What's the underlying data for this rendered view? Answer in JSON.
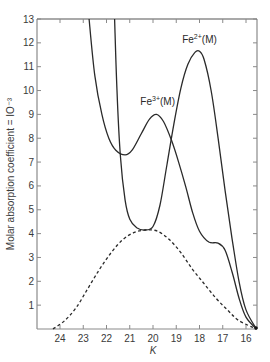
{
  "chart_data": {
    "type": "line",
    "title": "",
    "xlabel": "K",
    "ylabel": "Molar absorption coefficient = 10^-3",
    "ylabel_display": "Molar absorption coefficient = IO⁻³",
    "xlim": [
      25.0,
      15.5
    ],
    "ylim": [
      0,
      13
    ],
    "x_reversed": true,
    "grid": false,
    "x_ticks": [
      24,
      23,
      22,
      21,
      20,
      19,
      18,
      17,
      16
    ],
    "y_ticks": [
      1,
      2,
      3,
      4,
      5,
      6,
      7,
      8,
      9,
      10,
      11,
      12,
      13
    ],
    "annotations": [
      {
        "text": "Fe3+(M)",
        "base": "Fe",
        "sup": "3+",
        "suffix": "(M)",
        "x": 19.8,
        "y": 9.4
      },
      {
        "text": "Fe2+(M)",
        "base": "Fe",
        "sup": "2+",
        "suffix": "(M)",
        "x": 18.0,
        "y": 12.0
      }
    ],
    "series": [
      {
        "name": "Fe3+(M) spectrum",
        "style": "solid",
        "points": [
          [
            22.75,
            13.0
          ],
          [
            22.5,
            10.6
          ],
          [
            22.2,
            9.0
          ],
          [
            21.9,
            8.0
          ],
          [
            21.6,
            7.5
          ],
          [
            21.2,
            7.3
          ],
          [
            20.9,
            7.5
          ],
          [
            20.5,
            8.2
          ],
          [
            20.15,
            8.8
          ],
          [
            19.85,
            9.0
          ],
          [
            19.55,
            8.7
          ],
          [
            19.2,
            7.9
          ],
          [
            18.9,
            7.0
          ],
          [
            18.6,
            6.0
          ],
          [
            18.3,
            4.9
          ],
          [
            18.0,
            4.1
          ],
          [
            17.6,
            3.65
          ],
          [
            17.2,
            3.6
          ],
          [
            16.9,
            3.3
          ],
          [
            16.6,
            2.4
          ],
          [
            16.3,
            1.3
          ],
          [
            16.0,
            0.5
          ],
          [
            15.55,
            0.0
          ]
        ]
      },
      {
        "name": "Fe2+(M) spectrum",
        "style": "solid",
        "points": [
          [
            21.65,
            13.0
          ],
          [
            21.55,
            10.0
          ],
          [
            21.4,
            7.2
          ],
          [
            21.2,
            5.4
          ],
          [
            21.0,
            4.6
          ],
          [
            20.7,
            4.25
          ],
          [
            20.35,
            4.15
          ],
          [
            20.0,
            4.3
          ],
          [
            19.7,
            5.2
          ],
          [
            19.4,
            6.9
          ],
          [
            19.1,
            8.6
          ],
          [
            18.8,
            10.1
          ],
          [
            18.5,
            11.1
          ],
          [
            18.2,
            11.6
          ],
          [
            18.0,
            11.65
          ],
          [
            17.8,
            11.3
          ],
          [
            17.5,
            10.0
          ],
          [
            17.2,
            8.0
          ],
          [
            16.9,
            5.8
          ],
          [
            16.6,
            3.8
          ],
          [
            16.3,
            2.0
          ],
          [
            16.0,
            0.8
          ],
          [
            15.55,
            0.0
          ]
        ]
      },
      {
        "name": "Difference / Gaussian band",
        "style": "dashed",
        "points": [
          [
            24.3,
            0.0
          ],
          [
            23.8,
            0.35
          ],
          [
            23.3,
            0.9
          ],
          [
            22.8,
            1.7
          ],
          [
            22.3,
            2.5
          ],
          [
            21.8,
            3.2
          ],
          [
            21.3,
            3.75
          ],
          [
            20.8,
            4.05
          ],
          [
            20.3,
            4.15
          ],
          [
            19.8,
            4.1
          ],
          [
            19.3,
            3.75
          ],
          [
            18.8,
            3.2
          ],
          [
            18.3,
            2.5
          ],
          [
            17.8,
            1.9
          ],
          [
            17.3,
            1.3
          ],
          [
            16.8,
            0.8
          ],
          [
            16.3,
            0.35
          ],
          [
            15.55,
            0.0
          ]
        ]
      }
    ]
  },
  "colors": {
    "axis": "#8a8a8a",
    "curve": "#2a2a2a",
    "background": "#ffffff"
  }
}
